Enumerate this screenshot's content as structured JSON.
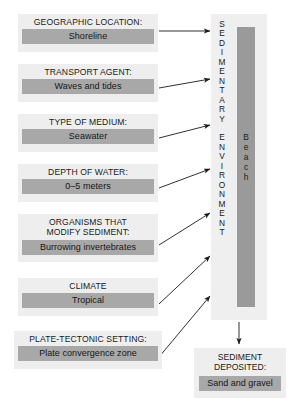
{
  "diagram": {
    "colors": {
      "panel_background": "#eeeeee",
      "value_background": "#a8a8a8",
      "column_background": "#efefef",
      "beach_bar": "#9a9a9a",
      "text": "#1a1a1a",
      "arrow": "#1a1a1a",
      "page_background": "#ffffff"
    }
  },
  "factors": [
    {
      "label": "GEOGRAPHIC LOCATION:",
      "value": "Shoreline"
    },
    {
      "label": "TRANSPORT AGENT:",
      "value": "Waves and tides"
    },
    {
      "label": "TYPE OF MEDIUM:",
      "value": "Seawater"
    },
    {
      "label": "DEPTH OF WATER:",
      "value": "0–5 meters"
    },
    {
      "label": "ORGANISMS THAT\nMODIFY SEDIMENT:",
      "value": "Burrowing invertebrates"
    },
    {
      "label": "CLIMATE",
      "value": "Tropical"
    },
    {
      "label": "PLATE-TECTONIC SETTING:",
      "value": "Plate convergence zone"
    }
  ],
  "environment": {
    "heading_vertical": "S\nE\nD\nI\nM\nE\nN\nT\nA\nR\nY\n\nE\nN\nV\nI\nR\nO\nN\nM\nE\nN\nT",
    "heading_plain": "SEDIMENTARY ENVIRONMENT",
    "result_vertical": "B\ne\na\nc\nh",
    "result_plain": "Beach"
  },
  "deposit": {
    "label": "SEDIMENT\nDEPOSITED:",
    "value": "Sand and gravel"
  }
}
